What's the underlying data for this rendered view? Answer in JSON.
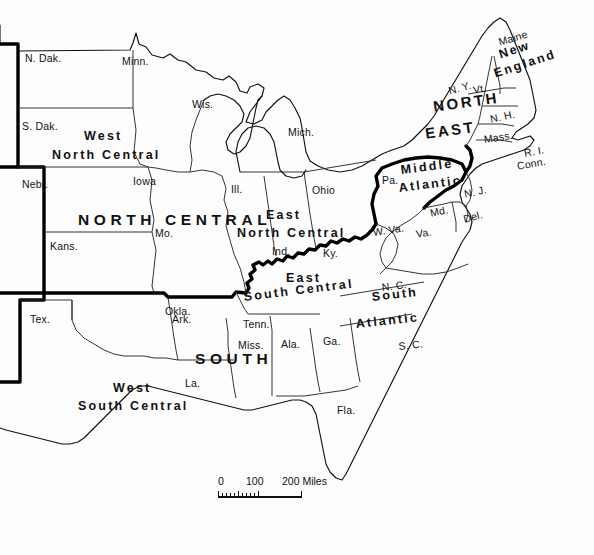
{
  "map": {
    "title": "United States Census Regions and Divisions",
    "background_color": "#fdfdfd",
    "line_color": "#111111",
    "regions": [
      {
        "name": "NORTH CENTRAL",
        "type": "major-region"
      },
      {
        "name": "NORTH EAST",
        "type": "major-region"
      },
      {
        "name": "SOUTH",
        "type": "major-region"
      }
    ],
    "divisions": [
      {
        "name": "West North Central"
      },
      {
        "name": "East North Central"
      },
      {
        "name": "New England"
      },
      {
        "name": "Middle Atlantic"
      },
      {
        "name": "South Atlantic"
      },
      {
        "name": "East South Central"
      },
      {
        "name": "West South Central"
      }
    ],
    "labels": {
      "north_central": "NORTH CENTRAL",
      "north": "NORTH",
      "east": "EAST",
      "south": "SOUTH",
      "west_nc_line1": "West",
      "west_nc_line2": "North Central",
      "east_nc_line1": "East",
      "east_nc_line2": "North Central",
      "new_england_line1": "New",
      "new_england_line2": "England",
      "middle_line1": "Middle",
      "middle_line2": "Atlantic",
      "south_atlantic_line1": "South",
      "south_atlantic_line2": "Atlantic",
      "east_sc_line1": "East",
      "east_sc_line2": "South Central",
      "west_sc_line1": "West",
      "west_sc_line2": "South Central"
    },
    "states": [
      {
        "abbr": "N. Dak.",
        "x": 25,
        "y": 52
      },
      {
        "abbr": "Minn.",
        "x": 122,
        "y": 55
      },
      {
        "abbr": "S. Dak.",
        "x": 22,
        "y": 120
      },
      {
        "abbr": "Wis.",
        "x": 192,
        "y": 98
      },
      {
        "abbr": "Mich.",
        "x": 288,
        "y": 126
      },
      {
        "abbr": "Nebr.",
        "x": 22,
        "y": 178
      },
      {
        "abbr": "Iowa",
        "x": 133,
        "y": 175
      },
      {
        "abbr": "Ill.",
        "x": 231,
        "y": 183
      },
      {
        "abbr": "Ohio",
        "x": 312,
        "y": 184
      },
      {
        "abbr": "Kans.",
        "x": 50,
        "y": 240
      },
      {
        "abbr": "Mo.",
        "x": 155,
        "y": 227
      },
      {
        "abbr": "Ind.",
        "x": 272,
        "y": 245
      },
      {
        "abbr": "Ky.",
        "x": 323,
        "y": 247
      },
      {
        "abbr": "Pa.",
        "x": 382,
        "y": 174
      },
      {
        "abbr": "N. Y.",
        "x": 447,
        "y": 85
      },
      {
        "abbr": "Vt.",
        "x": 472,
        "y": 84
      },
      {
        "abbr": "N. H.",
        "x": 489,
        "y": 113
      },
      {
        "abbr": "Maine",
        "x": 497,
        "y": 36
      },
      {
        "abbr": "Mass.",
        "x": 483,
        "y": 133
      },
      {
        "abbr": "R. I.",
        "x": 523,
        "y": 147
      },
      {
        "abbr": "Conn.",
        "x": 516,
        "y": 160
      },
      {
        "abbr": "N. J.",
        "x": 463,
        "y": 188
      },
      {
        "abbr": "Md.",
        "x": 429,
        "y": 207
      },
      {
        "abbr": "Del.",
        "x": 462,
        "y": 213
      },
      {
        "abbr": "W. Va.",
        "x": 372,
        "y": 226
      },
      {
        "abbr": "Va.",
        "x": 415,
        "y": 228
      },
      {
        "abbr": "N. C.",
        "x": 381,
        "y": 281
      },
      {
        "abbr": "S. C.",
        "x": 398,
        "y": 340
      },
      {
        "abbr": "Okla.",
        "x": 165,
        "y": 305
      },
      {
        "abbr": "Tex.",
        "x": 30,
        "y": 313
      },
      {
        "abbr": "Ark.",
        "x": 172,
        "y": 313
      },
      {
        "abbr": "Tenn.",
        "x": 243,
        "y": 318
      },
      {
        "abbr": "Miss.",
        "x": 238,
        "y": 339
      },
      {
        "abbr": "Ala.",
        "x": 281,
        "y": 338
      },
      {
        "abbr": "Ga.",
        "x": 323,
        "y": 335
      },
      {
        "abbr": "La.",
        "x": 185,
        "y": 377
      },
      {
        "abbr": "Fla.",
        "x": 337,
        "y": 404
      }
    ],
    "scale": {
      "zero": "0",
      "mid": "100",
      "max": "200 Miles",
      "unit": "Miles"
    }
  }
}
